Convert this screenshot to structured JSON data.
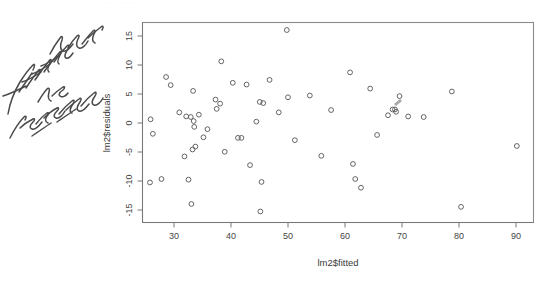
{
  "page": {
    "background_color": "#ffffff",
    "width": 547,
    "height": 281,
    "clipped_top_text": ". . .   .    .      .     .       .         ."
  },
  "annotation": {
    "handwritten_text": "fitted values vs residuals",
    "ink_color": "#4a4a4a",
    "style": "handwritten-cursive-rotated"
  },
  "chart_data": {
    "type": "scatter",
    "title": "",
    "xlabel": "lm2$fitted",
    "ylabel": "lm2$residuals",
    "xlim": [
      25.5,
      93.5
    ],
    "ylim": [
      -16.5,
      18.0
    ],
    "xticks": [
      30,
      40,
      50,
      60,
      70,
      80,
      90
    ],
    "yticks": [
      15,
      10,
      5,
      0,
      -5,
      -10,
      -15
    ],
    "xticklabels": [
      "30",
      "40",
      "50",
      "60",
      "70",
      "80",
      "90"
    ],
    "yticklabels": [
      "15",
      "10",
      "5",
      "0",
      "-5",
      "-10",
      "-15"
    ],
    "grid": false,
    "legend": false,
    "marker": "open-circle",
    "marker_color": "#555555",
    "points": [
      [
        26.9,
        1.3
      ],
      [
        26.8,
        -9.6
      ],
      [
        27.3,
        -1.2
      ],
      [
        28.8,
        -9.0
      ],
      [
        29.6,
        8.6
      ],
      [
        30.4,
        7.2
      ],
      [
        31.9,
        2.5
      ],
      [
        32.8,
        -5.1
      ],
      [
        33.1,
        1.8
      ],
      [
        33.5,
        -9.1
      ],
      [
        33.9,
        1.7
      ],
      [
        34.0,
        -13.3
      ],
      [
        34.3,
        6.2
      ],
      [
        34.4,
        1.0
      ],
      [
        34.5,
        0.0
      ],
      [
        34.7,
        -3.4
      ],
      [
        34.2,
        -3.9
      ],
      [
        35.3,
        2.1
      ],
      [
        36.1,
        -1.8
      ],
      [
        36.8,
        -0.4
      ],
      [
        38.2,
        4.7
      ],
      [
        38.4,
        3.1
      ],
      [
        39.0,
        4.0
      ],
      [
        39.2,
        11.3
      ],
      [
        39.8,
        -4.3
      ],
      [
        41.2,
        7.6
      ],
      [
        42.1,
        -1.9
      ],
      [
        42.7,
        -1.9
      ],
      [
        43.6,
        7.3
      ],
      [
        44.2,
        -6.6
      ],
      [
        45.3,
        0.9
      ],
      [
        45.9,
        4.3
      ],
      [
        46.5,
        4.1
      ],
      [
        46.2,
        -9.5
      ],
      [
        46.0,
        -14.6
      ],
      [
        47.6,
        8.1
      ],
      [
        49.2,
        2.5
      ],
      [
        50.6,
        16.7
      ],
      [
        50.8,
        5.1
      ],
      [
        52.0,
        -2.3
      ],
      [
        54.6,
        5.4
      ],
      [
        56.6,
        -5.0
      ],
      [
        58.3,
        2.9
      ],
      [
        61.6,
        9.4
      ],
      [
        62.1,
        -6.4
      ],
      [
        62.5,
        -9.0
      ],
      [
        63.5,
        -10.5
      ],
      [
        65.1,
        6.6
      ],
      [
        66.3,
        -1.4
      ],
      [
        68.2,
        2.0
      ],
      [
        69.0,
        3.0
      ],
      [
        69.4,
        3.0
      ],
      [
        69.6,
        2.6
      ],
      [
        70.2,
        5.3
      ],
      [
        71.7,
        1.8
      ],
      [
        74.4,
        1.7
      ],
      [
        79.3,
        6.1
      ],
      [
        80.9,
        -13.8
      ],
      [
        90.6,
        -3.3
      ]
    ]
  }
}
